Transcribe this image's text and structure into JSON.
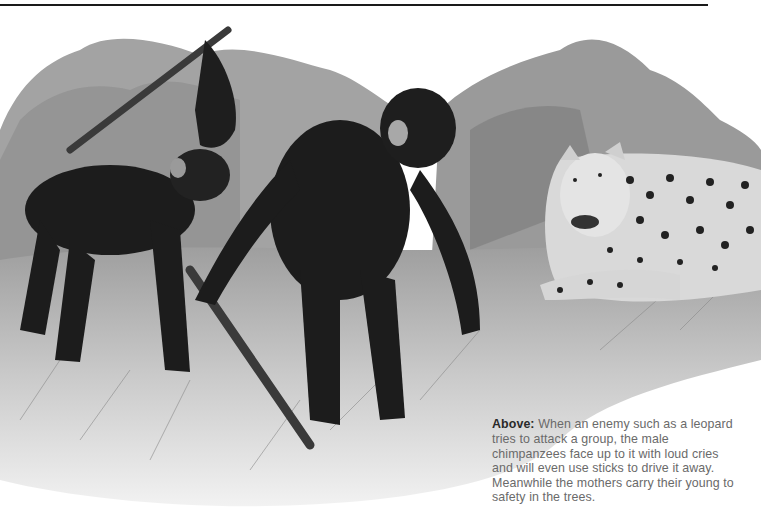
{
  "page": {
    "top_rule": true
  },
  "illustration": {
    "description": "Grayscale painting: two chimpanzees wielding sticks confronting a leopard in tall savanna grass with trees behind",
    "subjects": [
      "chimpanzee-with-raised-stick",
      "chimpanzee-dragging-stick",
      "leopard"
    ],
    "colors": {
      "sky": "#ffffff",
      "trees": "#9a9a9a",
      "trees_dark": "#6e6e6e",
      "grass": "#c8c8c8",
      "chimp": "#1c1c1c",
      "stick": "#3a3a3a",
      "leopard": "#d9d9d9",
      "spots": "#222222"
    }
  },
  "caption": {
    "lead": "Above:",
    "text": " When an enemy such as a leopard tries to attack a group, the male chimpanzees face up to it with loud cries and will even use sticks to drive it away. Meanwhile the mothers carry their young to safety in the trees."
  }
}
